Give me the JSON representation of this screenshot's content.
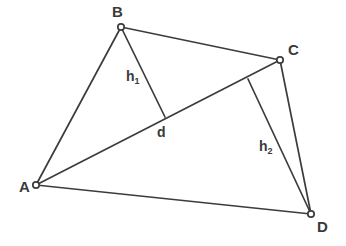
{
  "figure": {
    "kind": "geometry-diagram",
    "background_color": "#ffffff",
    "stroke_color": "#3c3c3c",
    "label_color": "#3a3a3a",
    "vertex_fill_color": "#ffffff"
  },
  "vertices": [
    {
      "id": "A",
      "label": "A",
      "x": 36,
      "y": 185,
      "label_x": 19,
      "label_y": 179
    },
    {
      "id": "B",
      "label": "B",
      "x": 121,
      "y": 27,
      "label_x": 112,
      "label_y": 4
    },
    {
      "id": "C",
      "label": "C",
      "x": 280,
      "y": 60,
      "label_x": 288,
      "label_y": 42
    },
    {
      "id": "D",
      "label": "D",
      "x": 311,
      "y": 214,
      "label_x": 317,
      "label_y": 219
    }
  ],
  "edges": [
    {
      "id": "AB",
      "from": "A",
      "to": "B",
      "x1": 36,
      "y1": 185,
      "x2": 121,
      "y2": 27
    },
    {
      "id": "BC",
      "from": "B",
      "to": "C",
      "x1": 121,
      "y1": 27,
      "x2": 280,
      "y2": 60
    },
    {
      "id": "CD",
      "from": "C",
      "to": "D",
      "x1": 280,
      "y1": 60,
      "x2": 311,
      "y2": 214
    },
    {
      "id": "DA",
      "from": "D",
      "to": "A",
      "x1": 311,
      "y1": 214,
      "x2": 36,
      "y2": 185
    }
  ],
  "diagonal": {
    "id": "AC",
    "from": "A",
    "to": "C",
    "x1": 36,
    "y1": 185,
    "x2": 280,
    "y2": 60,
    "label": "d",
    "label_x": 157,
    "label_y": 125
  },
  "altitudes": [
    {
      "id": "h1",
      "from": "B",
      "foot_on": "AC",
      "x1": 121,
      "y1": 27,
      "x2": 165,
      "y2": 117,
      "label_base": "h",
      "label_sub": "1",
      "label_x": 126,
      "label_y": 69
    },
    {
      "id": "h2",
      "from": "D",
      "foot_on": "AC",
      "x1": 311,
      "y1": 214,
      "x2": 248,
      "y2": 79,
      "label_base": "h",
      "label_sub": "2",
      "label_x": 259,
      "label_y": 139
    }
  ]
}
